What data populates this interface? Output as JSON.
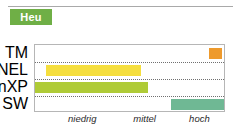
{
  "badge": {
    "label": "Heu",
    "background_color": "#6faf46",
    "text_color": "#ffffff"
  },
  "divider": {
    "color": "#a9a9a9"
  },
  "chart_data": {
    "type": "bar",
    "orientation": "horizontal",
    "title": "Heu",
    "xlabel": "",
    "ylabel": "",
    "grid": true,
    "legend_position": "none",
    "categories": [
      "TM",
      "NEL",
      "nXP",
      "SW"
    ],
    "x_tick_labels": [
      "niedrig",
      "mittel",
      "hoch"
    ],
    "x_tick_positions": [
      0.25,
      0.58,
      0.87
    ],
    "xlim": [
      0,
      1
    ],
    "bars": [
      {
        "category": "TM",
        "start": 0.92,
        "end": 0.99,
        "color": "#ee9a2c",
        "level": "hoch"
      },
      {
        "category": "NEL",
        "start": 0.06,
        "end": 0.56,
        "color": "#f5de3e",
        "level": "niedrig-mittel"
      },
      {
        "category": "nXP",
        "start": 0.0,
        "end": 0.6,
        "color": "#afcb37",
        "level": "niedrig-mittel"
      },
      {
        "category": "SW",
        "start": 0.72,
        "end": 1.0,
        "color": "#6fb894",
        "level": "hoch"
      }
    ],
    "frame_color": "#b6b6b6",
    "gridline_color": "#707070"
  }
}
